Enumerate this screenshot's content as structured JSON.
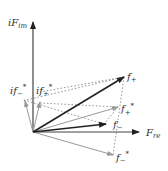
{
  "diagram": {
    "axes": {
      "imaginary_label": "iF",
      "imaginary_sub": "im",
      "real_label": "F",
      "real_sub": "re"
    },
    "vectors": [
      {
        "id": "f_plus",
        "label": "f",
        "sub": "+",
        "sup": "",
        "style": "bold"
      },
      {
        "id": "f_plus_star",
        "label": "f",
        "sub": "+",
        "sup": "*",
        "style": "gray"
      },
      {
        "id": "f_minus",
        "label": "f",
        "sub": "−",
        "sup": "",
        "style": "bold"
      },
      {
        "id": "f_minus_star",
        "label": "f",
        "sub": "−",
        "sup": "*",
        "style": "gray"
      },
      {
        "id": "if_minus_star",
        "label": "if",
        "sub": "−",
        "sup": "*",
        "style": "gray"
      },
      {
        "id": "if_plus_star",
        "label": "if",
        "sub": "+",
        "sup": "*",
        "style": "gray"
      }
    ]
  }
}
